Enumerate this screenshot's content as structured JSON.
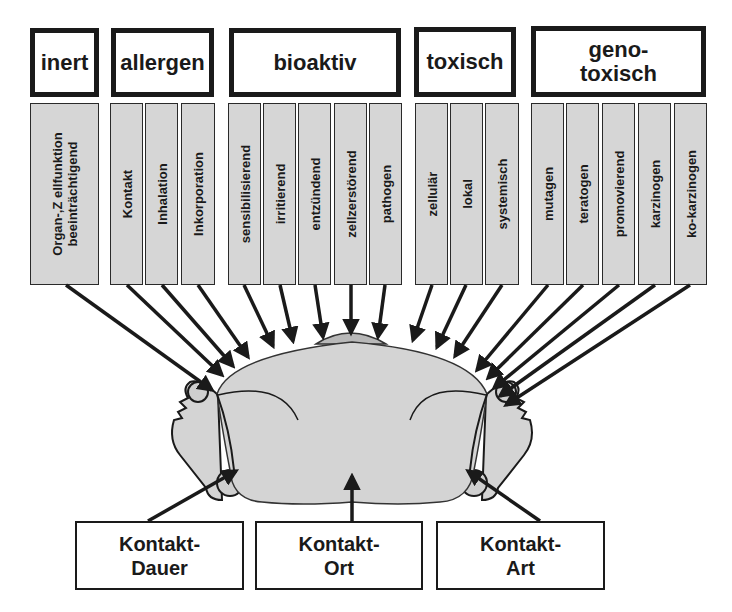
{
  "categories": [
    {
      "id": "inert",
      "label": "inert"
    },
    {
      "id": "allergen",
      "label": "allergen"
    },
    {
      "id": "bioaktiv",
      "label": "bioaktiv"
    },
    {
      "id": "toxisch",
      "label": "toxisch"
    },
    {
      "id": "genotoxisch",
      "label_line1": "geno-",
      "label_line2": "toxisch"
    }
  ],
  "subcategories": {
    "inert": [
      {
        "line1": "Organ-,Z ellfunktion",
        "line2": "beeinträchtigend"
      }
    ],
    "allergen": [
      {
        "label": "Kontakt"
      },
      {
        "label": "Inhalation"
      },
      {
        "label": "Inkorporation"
      }
    ],
    "bioaktiv": [
      {
        "label": "sensibilisierend"
      },
      {
        "label": "irritierend"
      },
      {
        "label": "entzündend"
      },
      {
        "label": "zellzerstörend"
      },
      {
        "label": "pathogen"
      }
    ],
    "toxisch": [
      {
        "label": "zellulär"
      },
      {
        "label": "lokal"
      },
      {
        "label": "systemisch"
      }
    ],
    "genotoxisch": [
      {
        "label": "mutagen"
      },
      {
        "label": "teratogen"
      },
      {
        "label": "promovierend"
      },
      {
        "label": "karzinogen"
      },
      {
        "label": "ko-karzinogen"
      }
    ]
  },
  "contact_factors": [
    {
      "line1": "Kontakt-",
      "line2": "Dauer"
    },
    {
      "line1": "Kontakt-",
      "line2": "Ort"
    },
    {
      "line1": "Kontakt-",
      "line2": "Art"
    }
  ],
  "colors": {
    "box_border": "#1a1a1a",
    "column_fill": "#d6d6d6",
    "body_fill": "#d4d4d4"
  }
}
